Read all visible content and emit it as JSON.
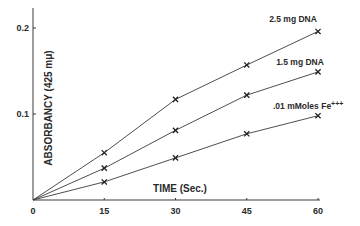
{
  "chart_data": {
    "type": "line",
    "title": "",
    "xlabel": "TIME (Sec.)",
    "ylabel": "ABSORBANCY (425 mμ)",
    "x": [
      0,
      15,
      30,
      45,
      60
    ],
    "xticks": [
      "0",
      "15",
      "30",
      "45",
      "60"
    ],
    "yticks": [
      "0.1",
      "0.2"
    ],
    "xlim": [
      0,
      60
    ],
    "ylim": [
      0,
      0.22
    ],
    "grid": false,
    "legend_position": "inline labels at line ends",
    "marker": "x",
    "series": [
      {
        "name": "2.5 mg DNA",
        "values": [
          0,
          0.055,
          0.117,
          0.157,
          0.196
        ]
      },
      {
        "name": "1.5 mg DNA",
        "values": [
          0,
          0.037,
          0.081,
          0.122,
          0.149
        ]
      },
      {
        "name": ".01 mMoles Fe+++",
        "values": [
          0,
          0.021,
          0.049,
          0.077,
          0.098
        ]
      }
    ],
    "line_color": "#3a3a3a"
  },
  "labels": {
    "y_axis": "ABSORBANCY  (425 mμ)",
    "x_axis": "TIME  (Sec.)",
    "series_label_0": "2.5 mg DNA",
    "series_label_1": "1.5 mg DNA",
    "series_label_2": ".01 mMoles Fe",
    "series_label_2_sup": "+++"
  }
}
